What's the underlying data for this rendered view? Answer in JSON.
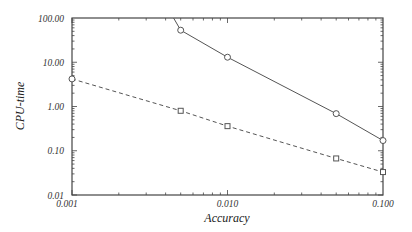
{
  "chart_data": {
    "type": "line",
    "title": "",
    "xlabel": "Accuracy",
    "ylabel": "CPU-time",
    "xscale": "log",
    "yscale": "log",
    "xlim": [
      0.001,
      0.1
    ],
    "ylim": [
      0.01,
      100
    ],
    "x_ticks": [
      "0.001",
      "0.010",
      "0.100"
    ],
    "y_ticks": [
      "0.01",
      "0.10",
      "1.00",
      "10.00",
      "100.00"
    ],
    "grid": false,
    "legend": null,
    "series": [
      {
        "name": "solid-circle",
        "style": "solid",
        "marker": "circle",
        "x": [
          0.0045,
          0.005,
          0.01,
          0.05,
          0.1
        ],
        "y": [
          100,
          53,
          13,
          0.69,
          0.17
        ],
        "marker_mask": [
          false,
          true,
          true,
          true,
          true
        ]
      },
      {
        "name": "dashed-square",
        "style": "dashed",
        "marker": "square",
        "x": [
          0.001,
          0.005,
          0.01,
          0.05,
          0.1
        ],
        "y": [
          4.2,
          0.8,
          0.36,
          0.067,
          0.033
        ],
        "first_marker": "circle"
      }
    ],
    "colors": {
      "line": "#555555",
      "frame": "#444444"
    }
  }
}
